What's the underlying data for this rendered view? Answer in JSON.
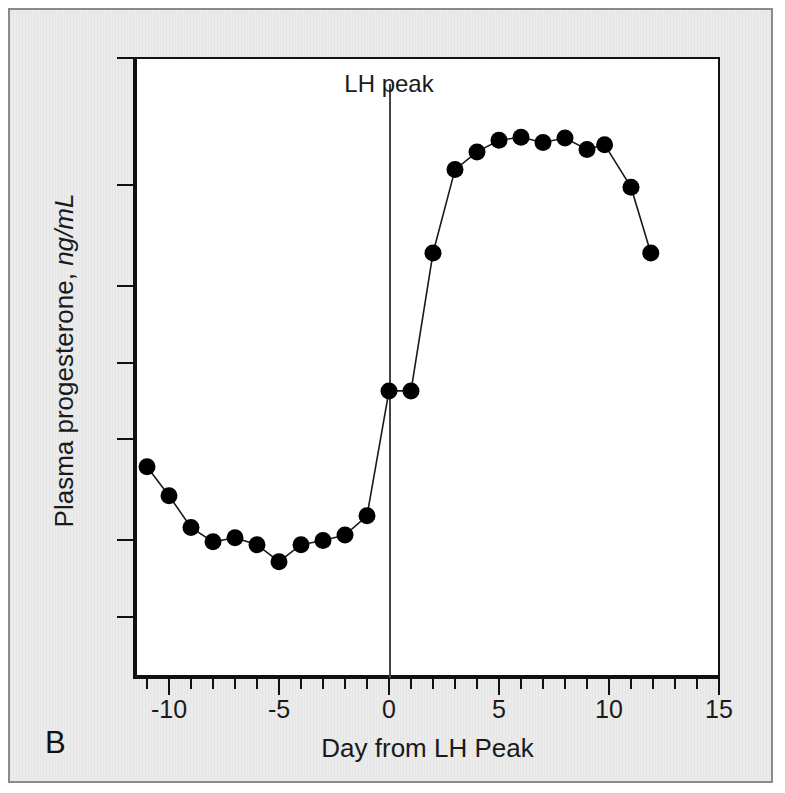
{
  "figure": {
    "panel_label": "B",
    "background_color": "#ebebeb",
    "plot_background_color": "#ffffff",
    "marker_color": "#000000",
    "line_color": "#1a1a1a"
  },
  "chart_data": {
    "type": "line",
    "title": "",
    "xlabel": "Day from LH Peak",
    "ylabel": "Plasma progesterone, ng/mL",
    "ylabel_plain": "Plasma progesterone, ",
    "ylabel_italic": "ng/mL",
    "yscale": "log",
    "ylim": [
      0.13,
      20
    ],
    "xlim": [
      -12.6,
      16.5
    ],
    "grid": false,
    "legend": null,
    "ytick_labels": [
      "20",
      "10",
      "4",
      "2",
      "1",
      "0.4",
      "0.2"
    ],
    "ytick_values": [
      20,
      10,
      4,
      2,
      1,
      0.4,
      0.2
    ],
    "xtick_labels": [
      "-10",
      "-5",
      "0",
      "5",
      "10",
      "15"
    ],
    "xtick_values": [
      -10,
      -5,
      0,
      5,
      10,
      15
    ],
    "xtick_minor_step": 1,
    "annotations": [
      {
        "text": "LH peak",
        "x": 0,
        "kind": "vertical-reference-line"
      }
    ],
    "series": [
      {
        "name": "Plasma progesterone",
        "marker": "filled-circle",
        "x": [
          -11,
          -10,
          -9,
          -8,
          -7,
          -6,
          -5,
          -4,
          -3,
          -2,
          -1,
          0,
          1,
          2,
          3,
          4,
          5,
          6,
          7,
          8,
          9,
          9.8,
          11,
          11.9
        ],
        "y": [
          0.78,
          0.6,
          0.45,
          0.395,
          0.41,
          0.385,
          0.33,
          0.385,
          0.4,
          0.42,
          0.5,
          1.55,
          1.55,
          5.4,
          11.5,
          13.5,
          15.0,
          15.4,
          14.7,
          15.3,
          13.8,
          14.4,
          9.8,
          5.4
        ]
      }
    ]
  }
}
